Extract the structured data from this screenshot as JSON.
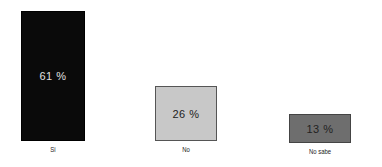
{
  "chart_data": {
    "type": "bar",
    "title": "",
    "xlabel": "",
    "ylabel": "",
    "categories": [
      "Si",
      "No",
      "No sabe"
    ],
    "values": [
      61,
      26,
      13
    ],
    "value_labels": [
      "61 %",
      "26 %",
      "13 %"
    ],
    "unit": "%",
    "ylim": [
      0,
      61
    ],
    "grid": false,
    "legend": null,
    "colors": [
      "#0a0a0a",
      "#c8c8c8",
      "#6e6e6e"
    ],
    "value_label_colors": [
      "#e0e0e0",
      "#222222",
      "#222222"
    ]
  }
}
